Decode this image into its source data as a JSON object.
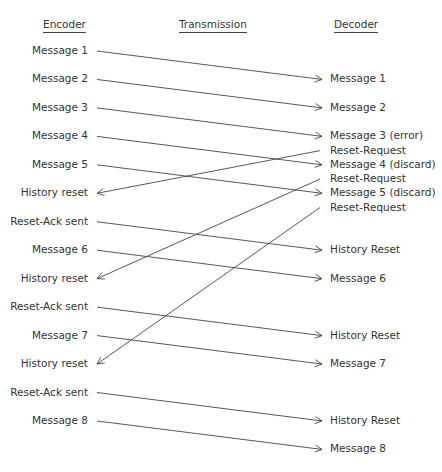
{
  "headers": {
    "encoder": "Encoder",
    "transmission": "Transmission",
    "decoder": "Decoder"
  },
  "encoder_events": [
    "Message 1",
    "Message 2",
    "Message 3",
    "Message 4",
    "Message 5",
    "History reset",
    "Reset-Ack sent",
    "Message 6",
    "History reset",
    "Reset-Ack sent",
    "Message 7",
    "History reset",
    "Reset-Ack sent",
    "Message 8"
  ],
  "decoder_events": [
    {
      "row": 1,
      "text": "Message 1"
    },
    {
      "row": 2,
      "text": "Message 2"
    },
    {
      "row": 3,
      "text": "Message 3 (error)"
    },
    {
      "row": 3.5,
      "text": "Reset-Request"
    },
    {
      "row": 4,
      "text": "Message 4 (discard)"
    },
    {
      "row": 4.5,
      "text": "Reset-Request"
    },
    {
      "row": 5,
      "text": "Message 5 (discard)"
    },
    {
      "row": 5.5,
      "text": "Reset-Request"
    },
    {
      "row": 7,
      "text": "History Reset"
    },
    {
      "row": 8,
      "text": "Message 6"
    },
    {
      "row": 10,
      "text": "History Reset"
    },
    {
      "row": 11,
      "text": "Message 7"
    },
    {
      "row": 13,
      "text": "History Reset"
    },
    {
      "row": 14,
      "text": "Message 8"
    }
  ],
  "arrows": [
    {
      "from": "encoder",
      "from_row": 0,
      "to_row": 1,
      "label": "Message 1"
    },
    {
      "from": "encoder",
      "from_row": 1,
      "to_row": 2,
      "label": "Message 2"
    },
    {
      "from": "encoder",
      "from_row": 2,
      "to_row": 3,
      "label": "Message 3"
    },
    {
      "from": "encoder",
      "from_row": 3,
      "to_row": 4,
      "label": "Message 4"
    },
    {
      "from": "encoder",
      "from_row": 4,
      "to_row": 5,
      "label": "Message 5"
    },
    {
      "from": "decoder",
      "from_row": 3.5,
      "to_row": 5,
      "label": "Reset-Request"
    },
    {
      "from": "decoder",
      "from_row": 4.5,
      "to_row": 8,
      "label": "Reset-Request"
    },
    {
      "from": "decoder",
      "from_row": 5.5,
      "to_row": 11,
      "label": "Reset-Request"
    },
    {
      "from": "encoder",
      "from_row": 6,
      "to_row": 7,
      "label": "Reset-Ack"
    },
    {
      "from": "encoder",
      "from_row": 7,
      "to_row": 8,
      "label": "Message 6"
    },
    {
      "from": "encoder",
      "from_row": 9,
      "to_row": 10,
      "label": "Reset-Ack"
    },
    {
      "from": "encoder",
      "from_row": 10,
      "to_row": 11,
      "label": "Message 7"
    },
    {
      "from": "encoder",
      "from_row": 12,
      "to_row": 13,
      "label": "Reset-Ack"
    },
    {
      "from": "encoder",
      "from_row": 13,
      "to_row": 14,
      "label": "Message 8"
    }
  ]
}
